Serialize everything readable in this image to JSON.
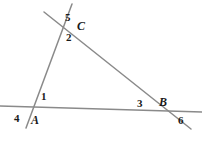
{
  "figure": {
    "type": "geometry-diagram",
    "background_color": "#ffffff",
    "line_color": "#8a8a8a",
    "label_color": "#1a1a1a",
    "line_width": 1.5,
    "width": 202,
    "height": 143
  },
  "lines": [
    {
      "name": "horizontal-line-through-A-and-B",
      "x1": 0,
      "y1": 106,
      "x2": 202,
      "y2": 112
    },
    {
      "name": "line-through-A-and-C",
      "x1": 26,
      "y1": 128,
      "x2": 72,
      "y2": 4
    },
    {
      "name": "line-through-C-and-B",
      "x1": 44,
      "y1": 12,
      "x2": 191,
      "y2": 129
    }
  ],
  "vertices": [
    {
      "name": "vertex-A",
      "label": "A",
      "x": 42,
      "y": 111
    },
    {
      "name": "vertex-B",
      "label": "B",
      "x": 168,
      "y": 110
    },
    {
      "name": "vertex-C",
      "label": "C",
      "x": 62,
      "y": 22
    }
  ],
  "labels": {
    "angle_5": "5",
    "point_C": "C",
    "angle_2": "2",
    "angle_1": "1",
    "angle_4": "4",
    "point_A": "A",
    "angle_3": "3",
    "point_B": "B",
    "angle_6": "6"
  }
}
